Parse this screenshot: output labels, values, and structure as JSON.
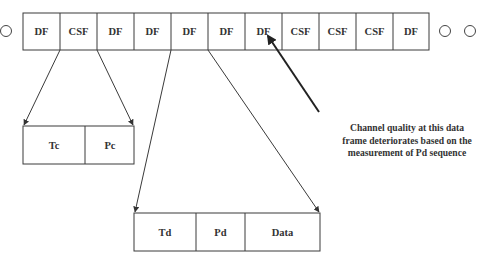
{
  "diagram": {
    "frame_sequence": {
      "cells": [
        "DF",
        "CSF",
        "DF",
        "DF",
        "DF",
        "DF",
        "DF",
        "CSF",
        "CSF",
        "CSF",
        "DF"
      ],
      "leading_ellipsis_circles": 1,
      "trailing_ellipsis_circles": 2
    },
    "csf_structure": {
      "fields": [
        "Tc",
        "Pc"
      ]
    },
    "df_structure": {
      "fields": [
        "Td",
        "Pd",
        "Data"
      ]
    },
    "annotation": {
      "lines": [
        "Channel quality at this data",
        "frame deteriorates based on the",
        "measurement of Pd  sequence"
      ],
      "target_cell_index": 6
    },
    "colors": {
      "line": "#3a3a3a",
      "text": "#333333",
      "background": "#ffffff"
    }
  }
}
